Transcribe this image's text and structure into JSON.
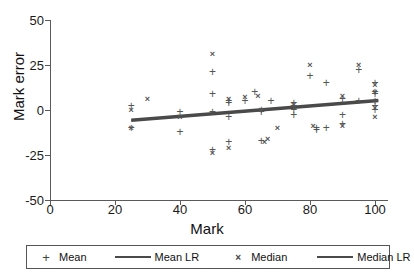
{
  "chart_data": {
    "type": "scatter",
    "title": "",
    "xlabel": "Mark",
    "ylabel": "Mark error",
    "xlim": [
      0,
      104
    ],
    "ylim": [
      -50,
      50
    ],
    "xticks": [
      0,
      20,
      40,
      60,
      80,
      100
    ],
    "yticks": [
      50,
      25,
      0,
      -25,
      -50
    ],
    "xticklabels": [
      "0",
      "20",
      "40",
      "60",
      "80",
      "100"
    ],
    "yticklabels": [
      "50",
      "25",
      "0",
      "-25",
      "-50"
    ],
    "grid": false,
    "legend_position": "below-axes",
    "series": [
      {
        "name": "Mean",
        "marker": "plus",
        "color": "#555555",
        "points": [
          [
            25,
            2
          ],
          [
            25,
            -10
          ],
          [
            40,
            -1
          ],
          [
            40,
            -12
          ],
          [
            50,
            21
          ],
          [
            50,
            9
          ],
          [
            50,
            -1
          ],
          [
            50,
            -22
          ],
          [
            55,
            5
          ],
          [
            55,
            4
          ],
          [
            55,
            -4
          ],
          [
            55,
            -18
          ],
          [
            60,
            5
          ],
          [
            63,
            10
          ],
          [
            65,
            0
          ],
          [
            65,
            -1
          ],
          [
            65,
            -17
          ],
          [
            68,
            5
          ],
          [
            75,
            4
          ],
          [
            75,
            2
          ],
          [
            75,
            0
          ],
          [
            75,
            -3
          ],
          [
            80,
            19
          ],
          [
            82,
            -10
          ],
          [
            82,
            -11
          ],
          [
            85,
            15
          ],
          [
            85,
            -10
          ],
          [
            90,
            6
          ],
          [
            90,
            -3
          ],
          [
            90,
            -8
          ],
          [
            95,
            22
          ],
          [
            95,
            5
          ],
          [
            100,
            15
          ],
          [
            100,
            10
          ],
          [
            100,
            9
          ],
          [
            100,
            5
          ],
          [
            100,
            2
          ],
          [
            100,
            0
          ]
        ]
      },
      {
        "name": "Median",
        "marker": "cross",
        "color": "#555555",
        "points": [
          [
            25,
            0
          ],
          [
            25,
            -10
          ],
          [
            30,
            6
          ],
          [
            40,
            -4
          ],
          [
            50,
            31
          ],
          [
            50,
            -24
          ],
          [
            55,
            6
          ],
          [
            55,
            -21
          ],
          [
            60,
            7
          ],
          [
            64,
            8
          ],
          [
            65,
            0
          ],
          [
            66,
            -18
          ],
          [
            67,
            -16
          ],
          [
            70,
            -10
          ],
          [
            75,
            3
          ],
          [
            80,
            25
          ],
          [
            81,
            -9
          ],
          [
            90,
            8
          ],
          [
            90,
            -9
          ],
          [
            95,
            25
          ],
          [
            100,
            14
          ],
          [
            100,
            10
          ],
          [
            100,
            1
          ],
          [
            100,
            -4
          ]
        ]
      }
    ],
    "regressions": [
      {
        "name": "Mean LR",
        "color": "#4a4a4a",
        "x0": 25,
        "y0": -5.5,
        "x1": 101,
        "y1": 5.5,
        "width": 2.6
      },
      {
        "name": "Median LR",
        "color": "#4a4a4a",
        "x0": 25,
        "y0": -6.0,
        "x1": 101,
        "y1": 5.0,
        "width": 2.6
      }
    ]
  },
  "legend": {
    "items": [
      {
        "symbol": "+",
        "label": "Mean"
      },
      {
        "symbol": "line",
        "label": "Mean LR"
      },
      {
        "symbol": "×",
        "label": "Median"
      },
      {
        "symbol": "line",
        "label": "Median LR"
      }
    ]
  }
}
